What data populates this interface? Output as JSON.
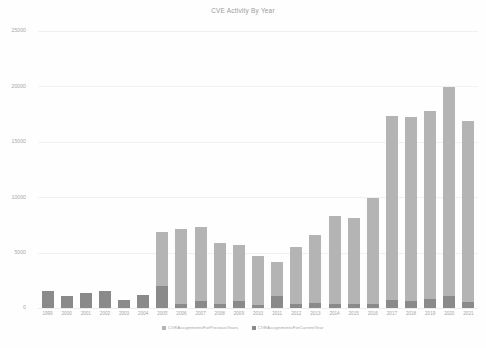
{
  "chart_data": {
    "type": "bar",
    "title": "CVE Activity By Year",
    "xlabel": "",
    "ylabel": "",
    "ylim": [
      0,
      25000
    ],
    "yticks": [
      0,
      5000,
      10000,
      15000,
      20000,
      25000
    ],
    "ytick_labels": [
      "0",
      "5000",
      "10000",
      "15000",
      "20000",
      "25000"
    ],
    "grid": true,
    "stacked": true,
    "legend_position": "bottom",
    "categories": [
      "1999",
      "2000",
      "2001",
      "2002",
      "2003",
      "2004",
      "2005",
      "2006",
      "2007",
      "2008",
      "2009",
      "2010",
      "2011",
      "2012",
      "2013",
      "2014",
      "2015",
      "2016",
      "2017",
      "2018",
      "2019",
      "2020",
      "2021"
    ],
    "series": [
      {
        "name": "CVEAssignmentsForCurrentYear",
        "color": "#8a8a8a",
        "values": [
          1550,
          1100,
          1350,
          1550,
          700,
          1150,
          2000,
          350,
          600,
          400,
          650,
          250,
          1050,
          400,
          450,
          400,
          350,
          400,
          700,
          600,
          800,
          1050,
          500
        ]
      },
      {
        "name": "CVEAssignmentsForPreviousYears",
        "color": "#b4b4b4",
        "values": [
          0,
          0,
          0,
          0,
          0,
          0,
          4850,
          6750,
          6700,
          5450,
          5050,
          4400,
          3100,
          5150,
          6100,
          7950,
          7750,
          9550,
          16650,
          16650,
          17000,
          18900,
          16400
        ]
      }
    ],
    "totals": [
      1550,
      1100,
      1350,
      1550,
      700,
      1150,
      6850,
      7100,
      7300,
      5850,
      5700,
      4650,
      4150,
      5550,
      6550,
      8350,
      8100,
      9950,
      17350,
      17250,
      17800,
      19950,
      16900
    ]
  },
  "legend": {
    "items": [
      {
        "label": "CVEAssignmentsForPreviousYears"
      },
      {
        "label": "CVEAssignmentsForCurrentYear"
      }
    ]
  },
  "colors": {
    "previous_years": "#b4b4b4",
    "current_year": "#8a8a8a",
    "gridline": "#f1f1f1",
    "text": "#a5a5a5",
    "background": "#fefefe"
  }
}
